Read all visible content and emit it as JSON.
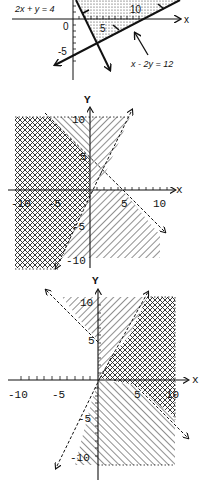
{
  "graphs": [
    {
      "id": "graph-1",
      "equations": {
        "line_a": "2x + y = 4",
        "line_b": "x - 2y = 12"
      },
      "axis": {
        "x_label": "x",
        "y_label": ""
      },
      "tick_labels": {
        "origin": "0",
        "x5": "5",
        "x10": "10",
        "y_neg5": "-5"
      },
      "shading": "dotted"
    },
    {
      "id": "graph-2",
      "axis": {
        "x_label": "x",
        "y_label": "Y"
      },
      "tick_labels": {
        "x_neg10": "-10",
        "x_neg5": "-5",
        "x5": "5",
        "x10": "10",
        "y10": "10",
        "y5": "5",
        "y_neg5": "-5",
        "y_neg10": "-10"
      },
      "shading": [
        "crosshatch",
        "diagonal-hatch"
      ]
    },
    {
      "id": "graph-3",
      "axis": {
        "x_label": "x",
        "y_label": "Y"
      },
      "tick_labels": {
        "x_neg10": "-10",
        "x_neg5": "-5",
        "x5": "5",
        "x10": "10",
        "y10": "10",
        "y5": "5",
        "y_neg5": "-5",
        "y_neg10": "-10"
      },
      "shading": [
        "crosshatch",
        "diagonal-hatch"
      ]
    }
  ],
  "colors": {
    "ink": "#111111",
    "paper": "#ffffff"
  }
}
